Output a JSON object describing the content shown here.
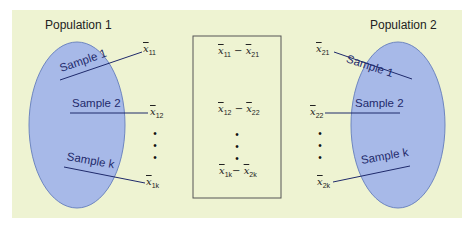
{
  "diagram": {
    "colors": {
      "background": "#eef3d2",
      "ellipse_fill": "#a7b9e8",
      "ellipse_stroke": "#6e86c0",
      "line": "#1f2a6b",
      "box_stroke": "#555555"
    },
    "population_1": {
      "title": "Population 1",
      "samples": [
        "Sample 1",
        "Sample 2",
        "Sample k"
      ],
      "means": [
        {
          "base": "x",
          "sub": "11"
        },
        {
          "base": "x",
          "sub": "12"
        },
        {
          "base": "x",
          "sub": "1k"
        }
      ]
    },
    "population_2": {
      "title": "Population 2",
      "samples": [
        "Sample 1",
        "Sample 2",
        "Sample k"
      ],
      "means": [
        {
          "base": "x",
          "sub": "21"
        },
        {
          "base": "x",
          "sub": "22"
        },
        {
          "base": "x",
          "sub": "2k"
        }
      ]
    },
    "differences": [
      {
        "a": "11",
        "b": "21",
        "op": "−"
      },
      {
        "a": "12",
        "b": "22",
        "op": "−"
      },
      {
        "a": "1k",
        "b": "2k",
        "op": "−"
      }
    ],
    "ellipsis": "•\n•\n•"
  }
}
